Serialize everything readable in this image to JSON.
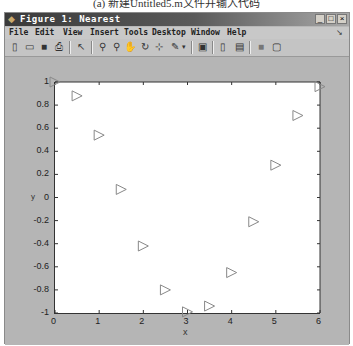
{
  "caption": "(a) 新建Untitled5.m文件并输入代码",
  "window": {
    "title": "Figure 1: Nearest",
    "controls": [
      "minimize",
      "maximize",
      "close"
    ]
  },
  "menubar": {
    "items": [
      "File",
      "Edit",
      "View",
      "Insert",
      "Tools",
      "Desktop",
      "Window",
      "Help"
    ],
    "dock_icon": "dock-arrow-icon"
  },
  "toolbar": {
    "buttons": [
      "new-figure-icon",
      "open-file-icon",
      "save-icon",
      "print-icon",
      "edit-plot-arrow-icon",
      "zoom-in-icon",
      "zoom-out-icon",
      "pan-hand-icon",
      "rotate-3d-icon",
      "data-cursor-icon",
      "brush-icon",
      "brush-dropdown-icon",
      "link-plot-icon",
      "insert-colorbar-icon",
      "insert-legend-icon",
      "hide-plot-tools-icon",
      "show-plot-tools-icon"
    ]
  },
  "chart_data": {
    "type": "scatter",
    "title": "",
    "xlabel": "x",
    "ylabel": "y",
    "marker": "triangle-right",
    "marker_color": "#888888",
    "xlim": [
      0,
      6
    ],
    "ylim": [
      -1,
      1
    ],
    "xticks": [
      "0",
      "1",
      "2",
      "3",
      "4",
      "5",
      "6"
    ],
    "yticks": [
      "1",
      "0.8",
      "0.6",
      "0.4",
      "0.2",
      "0",
      "-0.2",
      "-0.4",
      "-0.6",
      "-0.8",
      "-1"
    ],
    "grid": false,
    "x": [
      0,
      0.5,
      1,
      1.5,
      2,
      2.5,
      3,
      3.5,
      4,
      4.5,
      5,
      5.5,
      6
    ],
    "y": [
      1.0,
      0.88,
      0.54,
      0.07,
      -0.42,
      -0.8,
      -0.99,
      -0.94,
      -0.65,
      -0.21,
      0.28,
      0.71,
      0.96
    ]
  }
}
